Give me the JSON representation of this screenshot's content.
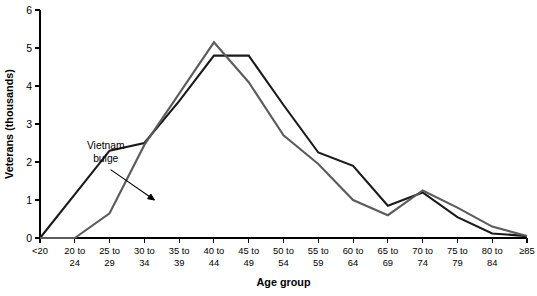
{
  "chart_data": {
    "type": "line",
    "title": "",
    "xlabel": "Age group",
    "ylabel": "Veterans (thousands)",
    "ylim": [
      0,
      6
    ],
    "yticks": [
      0,
      1,
      2,
      3,
      4,
      5,
      6
    ],
    "ytick_labels": [
      "0",
      "1",
      "2",
      "3",
      "4",
      "5",
      "6"
    ],
    "grid": false,
    "legend": "none",
    "categories": [
      "<20",
      "20 to 24",
      "25 to 29",
      "30 to 34",
      "35 to 39",
      "40 to 44",
      "45 to 49",
      "50 to 54",
      "55 to 59",
      "60 to 64",
      "65 to 69",
      "70 to 74",
      "75 to 79",
      "80 to 84",
      "≥85"
    ],
    "category_lines": [
      [
        "<20",
        ""
      ],
      [
        "20 to",
        "24"
      ],
      [
        "25 to",
        "29"
      ],
      [
        "30 to",
        "34"
      ],
      [
        "35 to",
        "39"
      ],
      [
        "40 to",
        "44"
      ],
      [
        "45 to",
        "49"
      ],
      [
        "50 to",
        "54"
      ],
      [
        "55 to",
        "59"
      ],
      [
        "60 to",
        "64"
      ],
      [
        "65 to",
        "69"
      ],
      [
        "70 to",
        "74"
      ],
      [
        "75 to",
        "79"
      ],
      [
        "80 to",
        "84"
      ],
      [
        "≥85",
        ""
      ]
    ],
    "series": [
      {
        "name": "black-series",
        "color": "#1a1a1a",
        "width": 2.1,
        "values": [
          0.0,
          1.15,
          2.3,
          2.5,
          3.6,
          4.8,
          4.8,
          3.5,
          2.25,
          1.9,
          0.85,
          1.2,
          0.55,
          0.12,
          0.05
        ]
      },
      {
        "name": "gray-series",
        "color": "#5c5c5c",
        "width": 2.1,
        "values": [
          0.0,
          0.0,
          0.65,
          2.45,
          3.8,
          5.15,
          4.1,
          2.7,
          1.95,
          1.0,
          0.6,
          1.25,
          0.8,
          0.3,
          0.05
        ]
      }
    ],
    "annotations": [
      {
        "text_lines": [
          "Vietnam",
          "bulge"
        ],
        "label": "vietnam-bulge",
        "text_x": 0.135,
        "text_y": 2.35,
        "arrow_from_x": 0.145,
        "arrow_from_y": 1.8,
        "arrow_to_x": 0.235,
        "arrow_to_y": 1.0
      }
    ]
  }
}
